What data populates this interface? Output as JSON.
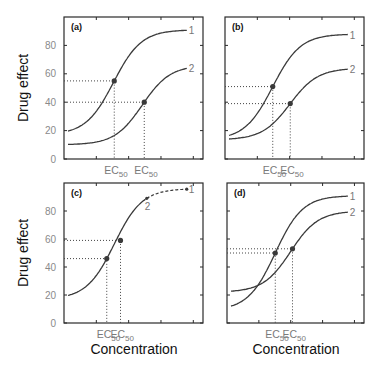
{
  "figure": {
    "ylabel": "Drug effect",
    "xlabel": "Concentration",
    "ec50_label": "EC",
    "ec50_sub": "50",
    "yticks": [
      "0",
      "20",
      "40",
      "60",
      "80"
    ]
  },
  "chart_data": [
    {
      "type": "line",
      "panel": "(a)",
      "title": "(a)",
      "xlabel": "",
      "ylabel": "Drug effect",
      "ylim": [
        0,
        100
      ],
      "yticks": [
        0,
        20,
        40,
        60,
        80
      ],
      "xticklabels": [
        "EC50",
        "EC50"
      ],
      "grid": false,
      "series": [
        {
          "name": "1",
          "baseline": 17,
          "emax": 91,
          "ec50_x": 0.37,
          "ec50_effect": 55,
          "endpoint": 90
        },
        {
          "name": "2",
          "baseline": 10,
          "emax": 66,
          "ec50_x": 0.61,
          "ec50_effect": 40,
          "endpoint": 61
        }
      ],
      "annotations": [
        "dotted lines from EC50 points to axes"
      ]
    },
    {
      "type": "line",
      "panel": "(b)",
      "title": "(b)",
      "xlabel": "",
      "ylabel": "",
      "ylim": [
        0,
        100
      ],
      "yticks": [
        0,
        20,
        40,
        60,
        80
      ],
      "xticklabels": [
        "EC50",
        "EC50"
      ],
      "grid": false,
      "series": [
        {
          "name": "1",
          "baseline": 13.5,
          "emax": 88,
          "ec50_x": 0.35,
          "ec50_effect": 51,
          "endpoint": 86
        },
        {
          "name": "2",
          "baseline": 13.5,
          "emax": 64,
          "ec50_x": 0.49,
          "ec50_effect": 39,
          "endpoint": 60
        }
      ],
      "annotations": [
        "same baseline, different Emax"
      ]
    },
    {
      "type": "line",
      "panel": "(c)",
      "title": "(c)",
      "xlabel": "Concentration",
      "ylabel": "Drug effect",
      "ylim": [
        0,
        100
      ],
      "yticks": [
        0,
        20,
        40,
        60,
        80
      ],
      "xticklabels": [
        "EC50",
        "EC50"
      ],
      "grid": false,
      "series": [
        {
          "name": "1",
          "baseline": 17,
          "emax": 96,
          "ec50_x": 0.31,
          "ec50_effect": 46,
          "endpoint": 88,
          "style": "dashed beyond 2"
        },
        {
          "name": "2",
          "baseline": 17,
          "emax": 96,
          "ec50_x": 0.42,
          "ec50_effect": 59,
          "endpoint": 76
        }
      ],
      "annotations": [
        "curve 2 is truncated portion of curve 1"
      ]
    },
    {
      "type": "line",
      "panel": "(d)",
      "title": "(d)",
      "xlabel": "Concentration",
      "ylabel": "",
      "ylim": [
        0,
        100
      ],
      "yticks": [
        0,
        20,
        40,
        60,
        80
      ],
      "xticklabels": [
        "EC50",
        "EC50"
      ],
      "grid": false,
      "series": [
        {
          "name": "1",
          "baseline": 9,
          "emax": 91,
          "ec50_x": 0.36,
          "ec50_effect": 50,
          "endpoint": 88
        },
        {
          "name": "2",
          "baseline": 22,
          "emax": 80,
          "ec50_x": 0.5,
          "ec50_effect": 53,
          "endpoint": 72
        }
      ],
      "annotations": [
        "curves cross"
      ]
    }
  ]
}
